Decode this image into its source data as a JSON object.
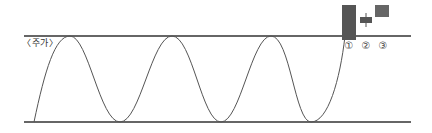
{
  "diagram": {
    "label": "〈주가〉",
    "resistance_line": {
      "y": 36,
      "x1": 24,
      "x2": 411
    },
    "support_line": {
      "y": 122,
      "x1": 24,
      "x2": 411
    },
    "wave": {
      "start": [
        34,
        122
      ],
      "peaks_x": [
        70,
        172,
        271
      ],
      "troughs_x": [
        120,
        221,
        311
      ],
      "end": [
        345,
        36
      ]
    },
    "candles": [
      {
        "num": "①",
        "body": {
          "x": 342,
          "y": 5,
          "w": 14,
          "h": 35
        }
      },
      {
        "num": "②",
        "body": {
          "x": 360,
          "y": 17,
          "w": 12,
          "h": 6
        },
        "wick": {
          "x": 366,
          "y1": 13,
          "y2": 27
        }
      },
      {
        "num": "③",
        "body": {
          "x": 375,
          "y": 5,
          "w": 14,
          "h": 12
        }
      }
    ],
    "colors": {
      "line": "#333333",
      "wave": "#555555",
      "candle": "#555555"
    }
  }
}
